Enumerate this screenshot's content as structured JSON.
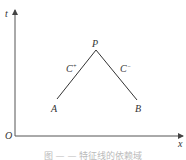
{
  "diagram": {
    "axes": {
      "vertical_label": "t",
      "horizontal_label": "x",
      "origin_label": "O"
    },
    "points": [
      {
        "name": "P",
        "label": "P"
      },
      {
        "name": "A",
        "label": "A"
      },
      {
        "name": "B",
        "label": "B"
      }
    ],
    "characteristics": [
      {
        "label_base": "C",
        "label_sup": "+",
        "from": "A",
        "to": "P"
      },
      {
        "label_base": "C",
        "label_sup": "−",
        "from": "P",
        "to": "B"
      }
    ],
    "caption": "图 — — 特征线的依赖域"
  }
}
